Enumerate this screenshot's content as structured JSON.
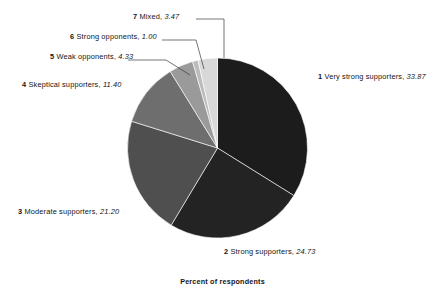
{
  "caption": "Percent of respondents",
  "chart_data": {
    "type": "pie",
    "title": "",
    "subtitle": "",
    "xlabel": "",
    "ylabel": "Percent of respondents",
    "legend_position": "callout-labels",
    "grid": false,
    "units": "percent",
    "start_angle_deg": 0,
    "direction": "clockwise",
    "total": 100.0,
    "categories": [
      "Very strong supporters",
      "Strong supporters",
      "Moderate supporters",
      "Skeptical supporters",
      "Weak opponents",
      "Strong opponents",
      "Mixed"
    ],
    "values": [
      33.87,
      24.73,
      21.2,
      11.4,
      4.33,
      1.0,
      3.47
    ],
    "slices": [
      {
        "index": "1",
        "label": "Very strong supporters",
        "value": "33.87",
        "value_num": 33.87,
        "color": "#1c1c1c",
        "label_side": "right"
      },
      {
        "index": "2",
        "label": "Strong supporters",
        "value": "24.73",
        "value_num": 24.73,
        "color": "#232323",
        "label_side": "bottom"
      },
      {
        "index": "3",
        "label": "Moderate supporters",
        "value": "21.20",
        "value_num": 21.2,
        "color": "#4f4f4f",
        "label_side": "left"
      },
      {
        "index": "4",
        "label": "Skeptical supporters",
        "value": "11.40",
        "value_num": 11.4,
        "color": "#6e6e6e",
        "label_side": "left"
      },
      {
        "index": "5",
        "label": "Weak opponents",
        "value": "4.33",
        "value_num": 4.33,
        "color": "#9a9a9a",
        "label_side": "left-leader"
      },
      {
        "index": "6",
        "label": "Strong opponents",
        "value": "1.00",
        "value_num": 1.0,
        "color": "#bcbcbc",
        "label_side": "left-leader"
      },
      {
        "index": "7",
        "label": "Mixed",
        "value": "3.47",
        "value_num": 3.47,
        "color": "#d8d8d8",
        "label_side": "left-leader"
      }
    ]
  }
}
